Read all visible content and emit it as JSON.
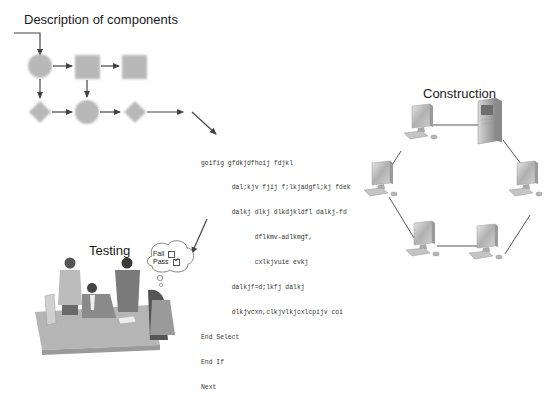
{
  "diagram": {
    "sections": {
      "description": {
        "title": "Description of components"
      },
      "construction": {
        "title": "Construction"
      },
      "testing": {
        "title": "Testing"
      }
    },
    "flowchart": {
      "nodes": [
        {
          "id": "n1",
          "shape": "circle",
          "row": 1,
          "col": 1
        },
        {
          "id": "n2",
          "shape": "square",
          "row": 1,
          "col": 2
        },
        {
          "id": "n3",
          "shape": "square",
          "row": 1,
          "col": 3
        },
        {
          "id": "n4",
          "shape": "diamond",
          "row": 2,
          "col": 1
        },
        {
          "id": "n5",
          "shape": "circle",
          "row": 2,
          "col": 2
        },
        {
          "id": "n6",
          "shape": "diamond",
          "row": 2,
          "col": 3
        }
      ],
      "fill_color": "#b8b8b8",
      "arrow_color": "#444444"
    },
    "code": {
      "lines": [
        "goifig gfdkjdfhoij fdjkl",
        "        dal;kjv fjij f;lkjadgfl;kj fdek",
        "        dalkj dlkj dlkdjkldfl dalkj-fd",
        "              dflkmv-adlkmgf,",
        "              cxlkjvuie evkj",
        "        dalkjf=d;lkfj dalkj",
        "        dlkjvcxn,clkjvlkjcxlcpijv coi",
        "End Select",
        "End If",
        "Next"
      ]
    },
    "thought_bubble": {
      "fail_label": "Fail",
      "pass_label": "Pass",
      "fail_checked": false,
      "pass_checked": true
    },
    "network": {
      "topology": "ring",
      "nodes": [
        "server",
        "workstation-top-left",
        "workstation-right",
        "workstation-bottom-right",
        "workstation-bottom-left",
        "workstation-left"
      ]
    }
  }
}
